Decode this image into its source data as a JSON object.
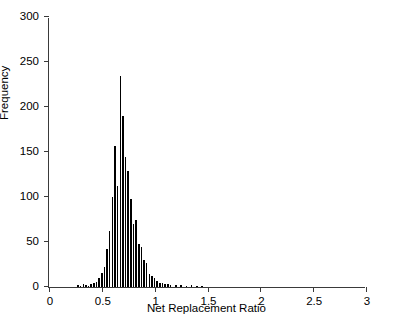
{
  "chart_data": {
    "type": "bar",
    "title": "",
    "subtitle": "",
    "xlabel": "Net Replacement Ratio",
    "ylabel": "Frequency",
    "xlim": [
      0,
      3
    ],
    "ylim": [
      0,
      300
    ],
    "xticks": [
      "0",
      "0.5",
      "1",
      "1.5",
      "2",
      "2.5",
      "3"
    ],
    "xtick_values": [
      0,
      0.5,
      1,
      1.5,
      2,
      2.5,
      3
    ],
    "yticks": [
      "0",
      "50",
      "100",
      "150",
      "200",
      "250",
      "300"
    ],
    "ytick_values": [
      0,
      50,
      100,
      150,
      200,
      250,
      300
    ],
    "grid": false,
    "legend": null,
    "bar_color": "#000000",
    "axis_color": "#3a3a3a",
    "bin_width": 0.025,
    "x": [
      0.275,
      0.3,
      0.325,
      0.35,
      0.375,
      0.4,
      0.425,
      0.45,
      0.475,
      0.5,
      0.525,
      0.55,
      0.575,
      0.6,
      0.625,
      0.65,
      0.675,
      0.7,
      0.725,
      0.75,
      0.775,
      0.8,
      0.825,
      0.85,
      0.875,
      0.9,
      0.925,
      0.95,
      0.975,
      1.0,
      1.025,
      1.05,
      1.075,
      1.1,
      1.125,
      1.15,
      1.2,
      1.25,
      1.3,
      1.35,
      1.4,
      1.45
    ],
    "values": [
      2,
      1,
      3,
      2,
      1,
      3,
      4,
      6,
      10,
      16,
      22,
      42,
      62,
      100,
      157,
      112,
      235,
      190,
      145,
      129,
      98,
      70,
      75,
      48,
      45,
      30,
      27,
      14,
      12,
      10,
      7,
      5,
      4,
      3,
      3,
      2,
      2,
      2,
      1,
      2,
      1,
      1
    ]
  }
}
